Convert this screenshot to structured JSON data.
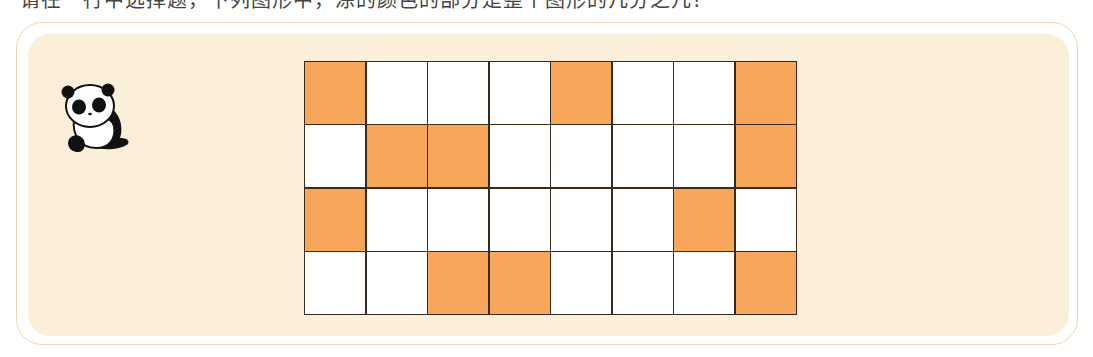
{
  "header": {
    "clipped_text": "请在一行中选择题，下列图形中，涂的颜色的部分是整个图形的几分之几？"
  },
  "panel": {
    "background_color": "#fcefd9",
    "border_color": "#f3d6b8"
  },
  "mascot": {
    "icon": "panda-icon"
  },
  "grid": {
    "rows": 4,
    "cols": 8,
    "filled_color": "#f8a65a",
    "empty_color": "#ffffff",
    "line_color": "#3a2a1e",
    "cells": [
      [
        1,
        0,
        0,
        0,
        1,
        0,
        0,
        1
      ],
      [
        0,
        1,
        1,
        0,
        0,
        0,
        0,
        1
      ],
      [
        1,
        0,
        0,
        0,
        0,
        0,
        1,
        0
      ],
      [
        0,
        0,
        1,
        1,
        0,
        0,
        0,
        1
      ]
    ],
    "filled_count": 11,
    "total_count": 32
  }
}
